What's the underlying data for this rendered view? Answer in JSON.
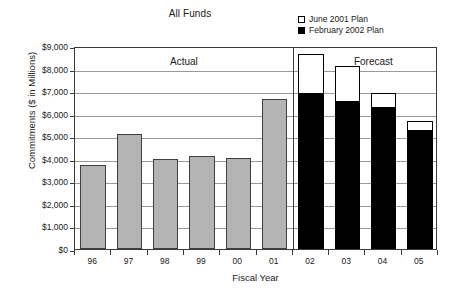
{
  "chart_data": {
    "type": "bar",
    "title": "All Funds",
    "xlabel": "Fiscal Year",
    "ylabel": "Commitments ($ in Millions)",
    "ylim": [
      0,
      9000
    ],
    "ytick_step": 1000,
    "ytick_labels": [
      "$9,000",
      "$8,000",
      "$7,000",
      "$6,000",
      "$5,000",
      "$4,000",
      "$3,000",
      "$2,000",
      "$1,000",
      "$0"
    ],
    "ytick_values": [
      9000,
      8000,
      7000,
      6000,
      5000,
      4000,
      3000,
      2000,
      1000,
      0
    ],
    "grid": true,
    "legend_position": "top-right",
    "categories": [
      "96",
      "97",
      "98",
      "99",
      "00",
      "01",
      "02",
      "03",
      "04",
      "05"
    ],
    "series": [
      {
        "name": "Actual",
        "style": "gray-filled",
        "values": [
          3740,
          5100,
          3980,
          4110,
          4030,
          6660,
          null,
          null,
          null,
          null
        ]
      },
      {
        "name": "June 2001 Plan",
        "style": "hollow",
        "values": [
          null,
          null,
          null,
          null,
          null,
          null,
          8650,
          8110,
          6930,
          5680
        ]
      },
      {
        "name": "February 2002 Plan",
        "style": "black-filled",
        "values": [
          null,
          null,
          null,
          null,
          null,
          null,
          6900,
          6550,
          6280,
          5280
        ]
      }
    ],
    "annotations": [
      {
        "text": "Actual",
        "region": "96-01"
      },
      {
        "text": "Forecast",
        "region": "02-05"
      }
    ],
    "divider_after_category": "01"
  },
  "legend": {
    "items": [
      {
        "label": "June 2001 Plan",
        "swatch": "hollow-square-icon",
        "color": "#ffffff"
      },
      {
        "label": "February 2002 Plan",
        "swatch": "filled-square-icon",
        "color": "#000000"
      }
    ]
  },
  "colors": {
    "actual_bar": "#b4b4b4",
    "plan_fill": "#000000",
    "plan_outline": "#ffffff",
    "gridline": "#9a9a9a",
    "axis": "#3b3b3b",
    "text": "#1a1a1a"
  }
}
